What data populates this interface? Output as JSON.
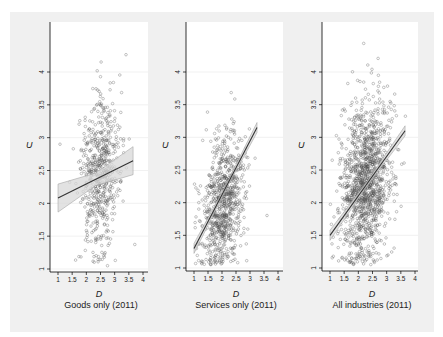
{
  "chart_data": [
    {
      "type": "scatter",
      "title": "Goods only (2011)",
      "xlabel": "D",
      "ylabel": "U",
      "xlim": [
        1,
        4
      ],
      "ylim": [
        1,
        4.5
      ],
      "xticks": [
        "1",
        "1.5",
        "2",
        "2.5",
        "3",
        "3.5",
        "4"
      ],
      "yticks": [
        "1",
        "1.5",
        "2",
        "2.5",
        "3",
        "3.5",
        "4"
      ],
      "grid": true,
      "fit_line": {
        "x": [
          1.0,
          3.65
        ],
        "y": [
          2.08,
          2.65
        ],
        "ci_band": true
      },
      "point_cloud": {
        "x_center": 2.5,
        "x_spread": 0.35,
        "y_center": 2.45,
        "y_spread": 0.6,
        "n": 600,
        "seed": 11
      }
    },
    {
      "type": "scatter",
      "title": "Services only (2011)",
      "xlabel": "D",
      "ylabel": "U",
      "xlim": [
        1,
        4
      ],
      "ylim": [
        1,
        4.5
      ],
      "xticks": [
        "1",
        "1.5",
        "2",
        "2.5",
        "3",
        "3.5",
        "4"
      ],
      "yticks": [
        "1",
        "1.5",
        "2",
        "2.5",
        "3",
        "3.5",
        "4"
      ],
      "grid": true,
      "fit_line": {
        "x": [
          1.0,
          3.25
        ],
        "y": [
          1.3,
          3.15
        ],
        "ci_band": true
      },
      "point_cloud": {
        "x_center": 2.05,
        "x_spread": 0.38,
        "y_center": 2.0,
        "y_spread": 0.5,
        "n": 800,
        "seed": 23
      }
    },
    {
      "type": "scatter",
      "title": "All industries (2011)",
      "xlabel": "D",
      "ylabel": "U",
      "xlim": [
        1,
        4
      ],
      "ylim": [
        1,
        4.5
      ],
      "xticks": [
        "1",
        "1.5",
        "2",
        "2.5",
        "3",
        "3.5",
        "4"
      ],
      "yticks": [
        "1",
        "1.5",
        "2",
        "2.5",
        "3",
        "3.5",
        "4"
      ],
      "grid": true,
      "fit_line": {
        "x": [
          1.0,
          3.65
        ],
        "y": [
          1.5,
          3.1
        ],
        "ci_band": true
      },
      "point_cloud": {
        "x_center": 2.25,
        "x_spread": 0.42,
        "y_center": 2.3,
        "y_spread": 0.6,
        "n": 1300,
        "seed": 37
      }
    }
  ],
  "panels": [
    {
      "caption": "Goods only (2011)",
      "xlabel": "D",
      "ylabel": "U"
    },
    {
      "caption": "Services only (2011)",
      "xlabel": "D",
      "ylabel": "U"
    },
    {
      "caption": "All industries (2011)",
      "xlabel": "D",
      "ylabel": "U"
    }
  ],
  "colors": {
    "marker": "#555555",
    "line": "#333333",
    "band": "#d8d8d8",
    "grid": "#e8e8e8"
  }
}
